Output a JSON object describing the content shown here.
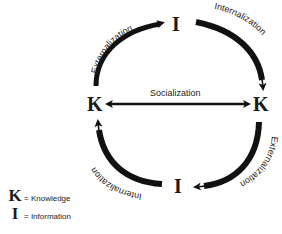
{
  "diagram": {
    "nodes": {
      "top": "I",
      "left": "K",
      "right": "K",
      "bottom": "I"
    },
    "edges": {
      "top_left": {
        "label": "Externalization",
        "from": "K (left)",
        "to": "I (top)"
      },
      "top_right": {
        "label": "Internalization",
        "from": "I (top)",
        "to": "K (right)"
      },
      "middle": {
        "label": "Socialization",
        "from": "K (left)",
        "to": "K (right)",
        "bidirectional": true
      },
      "bottom_right": {
        "label": "Externalization",
        "from": "K (right)",
        "to": "I (bottom)"
      },
      "bottom_left": {
        "label": "Internalization",
        "from": "I (bottom)",
        "to": "K (left)"
      }
    },
    "legend": [
      {
        "symbol": "K",
        "text": "= Knowledge"
      },
      {
        "symbol": "I",
        "text": "= Information"
      }
    ],
    "colors": {
      "stroke": "#111111",
      "text": "#222222",
      "background": "#ffffff"
    }
  }
}
